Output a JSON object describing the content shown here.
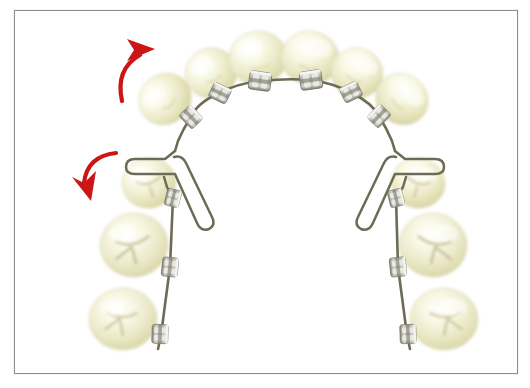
{
  "figure": {
    "width": 530,
    "height": 388,
    "background_color": "#ffffff",
    "border_color": "#8e8e8e"
  },
  "colors": {
    "tooth_light": "#fbfbe9",
    "tooth_mid": "#eeedce",
    "tooth_shade": "#dcd9a8",
    "tooth_deep": "#c9c48b",
    "wire": "#6d6b55",
    "bracket_metal": "#b9b9b2",
    "bracket_highlight": "#e7e7e2",
    "arrow_red": "#cc1616",
    "frame": "#8e8e8e",
    "canvas": "#ffffff"
  },
  "annotations": {
    "arrows": [
      {
        "name": "upper-movement-arrow",
        "label": "",
        "direction": "up-right",
        "color": "#cc1616",
        "tip_x": 136,
        "tip_y": 36
      },
      {
        "name": "lower-movement-arrow",
        "label": "",
        "direction": "down-left",
        "color": "#cc1616",
        "tip_x": 70,
        "tip_y": 186
      }
    ]
  },
  "arch": {
    "view": "occlusal",
    "anterior_teeth_count": 6,
    "posterior_teeth_per_side": 3,
    "total_teeth": 12,
    "bracket_count": 12,
    "loop_count": 2,
    "loop_type": "T-loop"
  },
  "teeth": {
    "anterior": [
      {
        "name": "tooth-upper-left-canine",
        "cx": 150,
        "cy": 88,
        "rx": 26,
        "ry": 24,
        "rot": -38
      },
      {
        "name": "tooth-upper-left-lateral",
        "cx": 196,
        "cy": 62,
        "rx": 25,
        "ry": 24,
        "rot": -22
      },
      {
        "name": "tooth-upper-left-central",
        "cx": 243,
        "cy": 47,
        "rx": 28,
        "ry": 26,
        "rot": -8
      },
      {
        "name": "tooth-upper-right-central",
        "cx": 295,
        "cy": 47,
        "rx": 28,
        "ry": 26,
        "rot": 8
      },
      {
        "name": "tooth-upper-right-lateral",
        "cx": 342,
        "cy": 62,
        "rx": 25,
        "ry": 24,
        "rot": 22
      },
      {
        "name": "tooth-upper-right-canine",
        "cx": 387,
        "cy": 88,
        "rx": 26,
        "ry": 24,
        "rot": 38
      }
    ],
    "posterior_left": [
      {
        "name": "tooth-left-first-premolar",
        "cx": 134,
        "cy": 172,
        "rx": 26,
        "ry": 24,
        "rot": -12
      },
      {
        "name": "tooth-left-second-premolar",
        "cx": 119,
        "cy": 234,
        "rx": 34,
        "ry": 32,
        "rot": -6
      },
      {
        "name": "tooth-left-first-molar",
        "cx": 108,
        "cy": 308,
        "rx": 34,
        "ry": 31,
        "rot": -3
      }
    ],
    "posterior_right": [
      {
        "name": "tooth-right-first-premolar",
        "cx": 403,
        "cy": 172,
        "rx": 26,
        "ry": 24,
        "rot": 12
      },
      {
        "name": "tooth-right-second-premolar",
        "cx": 418,
        "cy": 234,
        "rx": 34,
        "ry": 32,
        "rot": 6
      },
      {
        "name": "tooth-right-first-molar",
        "cx": 429,
        "cy": 308,
        "rx": 34,
        "ry": 31,
        "rot": 3
      }
    ]
  },
  "brackets": [
    {
      "name": "bracket-upper-left-canine",
      "x": 176,
      "y": 106,
      "rot": 46
    },
    {
      "name": "bracket-upper-left-lateral",
      "x": 205,
      "y": 82,
      "rot": 26
    },
    {
      "name": "bracket-upper-left-central",
      "x": 245,
      "y": 70,
      "rot": 8
    },
    {
      "name": "bracket-upper-right-central",
      "x": 296,
      "y": 68,
      "rot": -8
    },
    {
      "name": "bracket-upper-right-lateral",
      "x": 336,
      "y": 81,
      "rot": -26
    },
    {
      "name": "bracket-upper-right-canine",
      "x": 364,
      "y": 105,
      "rot": -46
    },
    {
      "name": "bracket-left-first-premolar",
      "x": 158,
      "y": 187,
      "rot": 104
    },
    {
      "name": "bracket-left-second-premolar",
      "x": 155,
      "y": 256,
      "rot": 96
    },
    {
      "name": "bracket-left-first-molar",
      "x": 144,
      "y": 323,
      "rot": 92
    },
    {
      "name": "bracket-right-first-premolar",
      "x": 381,
      "y": 187,
      "rot": 76
    },
    {
      "name": "bracket-right-second-premolar",
      "x": 383,
      "y": 256,
      "rot": 84
    },
    {
      "name": "bracket-right-first-molar",
      "x": 394,
      "y": 323,
      "rot": 88
    }
  ]
}
